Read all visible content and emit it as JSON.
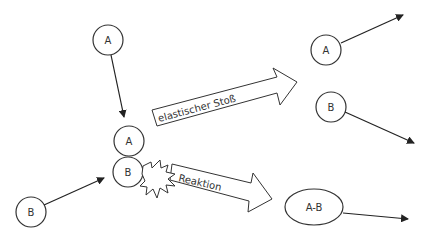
{
  "diagram": {
    "particles": {
      "a_initial": "A",
      "b_initial": "B",
      "a_collision": "A",
      "b_collision": "B",
      "a_after_elastic": "A",
      "b_after_elastic": "B",
      "product": "A-B"
    },
    "arrows": {
      "elastic_label": "elastischer Stoß",
      "reaction_label": "Reaktion"
    },
    "colors": {
      "stroke": "#333333",
      "background": "#ffffff"
    }
  }
}
